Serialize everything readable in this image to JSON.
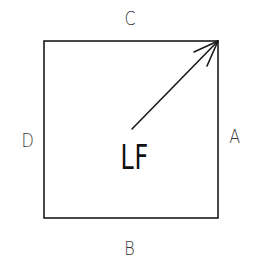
{
  "diagram": {
    "center_label": "LF",
    "sides": {
      "top": "C",
      "bottom": "B",
      "left": "D",
      "right": "A"
    },
    "arrow": {
      "from": "center",
      "to": "top-right corner"
    },
    "colors": {
      "stroke": "#1a1a1a",
      "label": "#3a3a3a",
      "background": "#ffffff"
    }
  }
}
